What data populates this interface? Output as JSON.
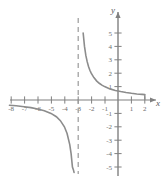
{
  "chart_data": {
    "type": "line",
    "title": "",
    "xlabel": "x",
    "ylabel": "y",
    "xlim": [
      -8.6,
      2.6
    ],
    "ylim": [
      -5.6,
      5.6
    ],
    "grid": false,
    "legend": "none",
    "xticks": [
      -8,
      -7,
      -6,
      -5,
      -4,
      -3,
      -2,
      -1,
      1,
      2
    ],
    "yticks": [
      5,
      4,
      3,
      2,
      1,
      -1,
      -2,
      -3,
      -4,
      -5
    ],
    "xtick_labels": [
      "-8",
      "-7",
      "-6",
      "-5",
      "-4",
      "-3",
      "-2",
      "-1",
      "1",
      "2"
    ],
    "ytick_labels": [
      "5",
      "4",
      "3",
      "2",
      "1",
      "-1",
      "-2",
      "-3",
      "-4",
      "-5"
    ],
    "annotations": [
      {
        "name": "vertical-asymptote",
        "style": "dashed",
        "x": -3,
        "label": "x = -3"
      },
      {
        "name": "horizontal-asymptote",
        "style": "implicit",
        "y": 0,
        "label": "y = 0"
      }
    ],
    "series": [
      {
        "name": "branch-right",
        "comment": "x > -3 branch, decreasing from +5 toward 0",
        "x": [
          -2.6,
          -2.5,
          -2.4,
          -2.3,
          -2.2,
          -2.1,
          -2.0,
          -1.8,
          -1.6,
          -1.4,
          -1.2,
          -1.0,
          -0.6,
          -0.2,
          0.2,
          0.6,
          1.0,
          1.4,
          1.8,
          2.0
        ],
        "y": [
          5.0,
          4.0,
          3.33,
          2.86,
          2.5,
          2.22,
          2.0,
          1.67,
          1.43,
          1.25,
          1.11,
          1.0,
          0.83,
          0.71,
          0.63,
          0.56,
          0.5,
          0.45,
          0.42,
          0.4
        ]
      },
      {
        "name": "branch-left",
        "comment": "x < -3 branch, decreasing from near 0 at x=-8 to -5 near x=-3.2",
        "x": [
          -8.1,
          -7.6,
          -7.0,
          -6.5,
          -6.0,
          -5.5,
          -5.0,
          -4.6,
          -4.3,
          -4.0,
          -3.8,
          -3.6,
          -3.5,
          -3.4,
          -3.33,
          -3.28
        ],
        "y": [
          -0.39,
          -0.43,
          -0.5,
          -0.57,
          -0.67,
          -0.8,
          -1.0,
          -1.25,
          -1.54,
          -2.0,
          -2.5,
          -3.33,
          -4.0,
          -5.0,
          -5.2,
          -5.4
        ]
      }
    ],
    "colors": {
      "curve": "#8c8c8c",
      "axis": "#808080",
      "asymptote": "#9a9a9a",
      "tick_text": "#6d6d6d",
      "axis_label": "#5a5a5a",
      "background": "#ffffff"
    }
  }
}
